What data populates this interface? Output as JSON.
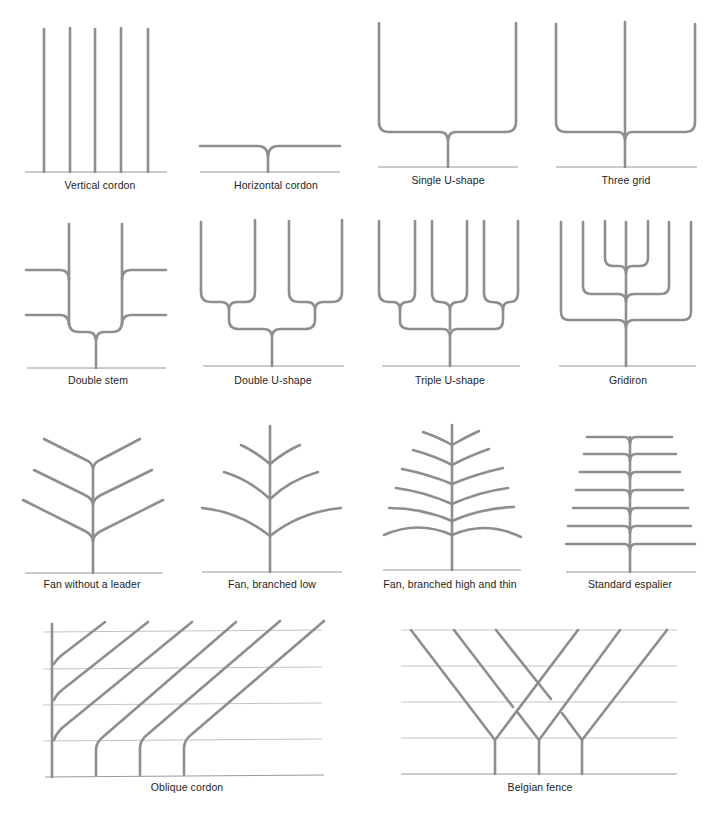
{
  "colors": {
    "branch": "#8e8e8e",
    "ground": "#9a9a9a",
    "wire": "#c4c4c4",
    "text": "#222222"
  },
  "forms": [
    {
      "id": "vertical-cordon",
      "label": "Vertical cordon"
    },
    {
      "id": "horizontal-cordon",
      "label": "Horizontal cordon"
    },
    {
      "id": "single-u-shape",
      "label": "Single U-shape"
    },
    {
      "id": "three-grid",
      "label": "Three grid"
    },
    {
      "id": "double-stem",
      "label": "Double stem"
    },
    {
      "id": "double-u-shape",
      "label": "Double U-shape"
    },
    {
      "id": "triple-u-shape",
      "label": "Triple U-shape"
    },
    {
      "id": "gridiron",
      "label": "Gridiron"
    },
    {
      "id": "fan-without-leader",
      "label": "Fan without a leader"
    },
    {
      "id": "fan-branched-low",
      "label": "Fan, branched low"
    },
    {
      "id": "fan-branched-high-thin",
      "label": "Fan, branched high and thin"
    },
    {
      "id": "standard-espalier",
      "label": "Standard espalier"
    },
    {
      "id": "oblique-cordon",
      "label": "Oblique cordon"
    },
    {
      "id": "belgian-fence",
      "label": "Belgian fence"
    }
  ]
}
